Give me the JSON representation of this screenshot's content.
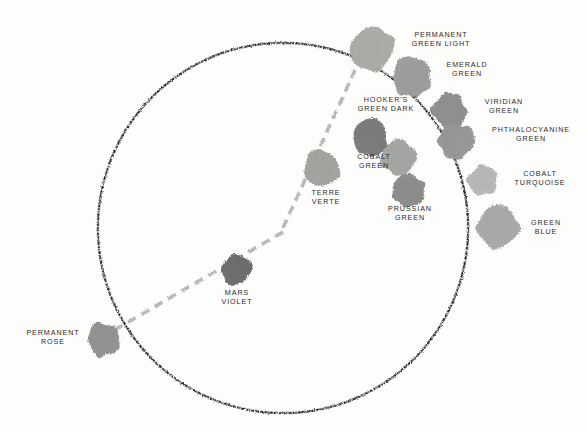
{
  "figure": {
    "type": "pigment-colour-wheel",
    "background_color": "#fdfdfc",
    "ink_color": "#1c1c1c",
    "label_color": "#2b2b2b"
  },
  "circle": {
    "name": "colour-wheel-circle",
    "center_x": 283,
    "center_y": 228,
    "radius": 185,
    "stroke_style": "hand-drawn speckled pencil",
    "stroke_color": "#1a1a1a"
  },
  "spokes": [
    {
      "name": "spoke-upper-left",
      "style": "dashed",
      "color": "#b9b9b9",
      "from_x": 283,
      "from_y": 228,
      "to_x": 365,
      "to_y": 48
    },
    {
      "name": "spoke-right-horizontal",
      "style": "dashed",
      "color": "#b9b9b9",
      "from_x": 283,
      "from_y": 232,
      "to_x": 468,
      "to_y": 232
    },
    {
      "name": "spoke-lower-left",
      "style": "dashed",
      "color": "#b9b9b9",
      "from_x": 283,
      "from_y": 232,
      "to_x": 100,
      "to_y": 338
    }
  ],
  "swatches": [
    {
      "id": "permanent-green-light",
      "label": "PERMANENT\nGREEN LIGHT",
      "label_align": "center",
      "label_x": 386,
      "label_y": 30,
      "label_width": 110,
      "swatch_x": 350,
      "swatch_y": 28,
      "swatch_w": 44,
      "swatch_h": 44,
      "fill": "#a9a9a6",
      "tone": "light-mid grey"
    },
    {
      "id": "emerald-green",
      "label": "EMERALD\nGREEN",
      "label_align": "center",
      "label_x": 424,
      "label_y": 60,
      "label_width": 86,
      "swatch_x": 393,
      "swatch_y": 57,
      "swatch_w": 38,
      "swatch_h": 40,
      "fill": "#9b9b99",
      "tone": "mid grey"
    },
    {
      "id": "hookers-green-dark",
      "label": "HOOKER'S\nGREEN DARK",
      "label_align": "center",
      "label_x": 341,
      "label_y": 95,
      "label_width": 90,
      "swatch_x": 352,
      "swatch_y": 120,
      "swatch_w": 36,
      "swatch_h": 36,
      "fill": "#787878",
      "tone": "dark grey"
    },
    {
      "id": "viridian-green",
      "label": "VIRIDIAN\nGREEN",
      "label_align": "center",
      "label_x": 464,
      "label_y": 97,
      "label_width": 80,
      "swatch_x": 432,
      "swatch_y": 93,
      "swatch_w": 34,
      "swatch_h": 36,
      "fill": "#8d8d8b",
      "tone": "mid-dark grey"
    },
    {
      "id": "phthalocyanine-green",
      "label": "PHTHALOCYANINE\nGREEN",
      "label_align": "center",
      "label_x": 475,
      "label_y": 125,
      "label_width": 112,
      "swatch_x": 438,
      "swatch_y": 124,
      "swatch_w": 36,
      "swatch_h": 36,
      "fill": "#959593",
      "tone": "mid grey"
    },
    {
      "id": "cobalt-green",
      "label": "COBALT\nGREEN",
      "label_align": "center",
      "label_x": 344,
      "label_y": 152,
      "label_width": 60,
      "swatch_x": 381,
      "swatch_y": 140,
      "swatch_w": 36,
      "swatch_h": 36,
      "fill": "#a3a3a1",
      "tone": "light-mid grey"
    },
    {
      "id": "terre-verte",
      "label": "TERRE\nVERTE",
      "label_align": "center",
      "label_x": 305,
      "label_y": 188,
      "label_width": 42,
      "swatch_x": 304,
      "swatch_y": 150,
      "swatch_w": 36,
      "swatch_h": 36,
      "fill": "#a1a19e",
      "tone": "light-mid grey"
    },
    {
      "id": "prussian-green",
      "label": "PRUSSIAN\nGREEN",
      "label_align": "center",
      "label_x": 376,
      "label_y": 204,
      "label_width": 68,
      "swatch_x": 391,
      "swatch_y": 175,
      "swatch_w": 34,
      "swatch_h": 32,
      "fill": "#8a8a88",
      "tone": "mid-dark grey"
    },
    {
      "id": "cobalt-turquoise",
      "label": "COBALT\nTURQUOISE",
      "label_align": "center",
      "label_x": 503,
      "label_y": 169,
      "label_width": 74,
      "swatch_x": 468,
      "swatch_y": 165,
      "swatch_w": 30,
      "swatch_h": 30,
      "fill": "#b5b5b3",
      "tone": "light grey"
    },
    {
      "id": "green-blue",
      "label": "GREEN\nBLUE",
      "label_align": "center",
      "label_x": 520,
      "label_y": 218,
      "label_width": 52,
      "swatch_x": 477,
      "swatch_y": 207,
      "swatch_w": 42,
      "swatch_h": 42,
      "fill": "#a7a7a5",
      "tone": "light-mid grey"
    },
    {
      "id": "mars-violet",
      "label": "MARS\nVIOLET",
      "label_align": "center",
      "label_x": 209,
      "label_y": 288,
      "label_width": 56,
      "swatch_x": 221,
      "swatch_y": 255,
      "swatch_w": 30,
      "swatch_h": 30,
      "fill": "#6b6b6b",
      "tone": "dark grey"
    },
    {
      "id": "permanent-rose",
      "label": "PERMANENT\nROSE",
      "label_align": "center",
      "label_x": 20,
      "label_y": 328,
      "label_width": 66,
      "swatch_x": 87,
      "swatch_y": 323,
      "swatch_w": 32,
      "swatch_h": 34,
      "fill": "#909090",
      "tone": "mid-dark grey"
    }
  ]
}
